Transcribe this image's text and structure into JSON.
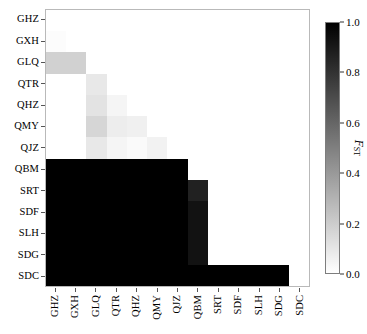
{
  "chart_data": {
    "type": "heatmap",
    "title": "",
    "xlabel": "",
    "ylabel": "",
    "colorbar_label": "F_ST",
    "colorbar_label_main": "F",
    "colorbar_label_sub": "ST",
    "colormap": "grayscale-reversed",
    "colormap_low_color": "#ffffff",
    "colormap_high_color": "#000000",
    "zlim": [
      0.0,
      1.0
    ],
    "colorbar_ticks": [
      "0.0",
      "0.2",
      "0.4",
      "0.6",
      "0.8",
      "1.0"
    ],
    "colorbar_tick_values": [
      0.0,
      0.2,
      0.4,
      0.6,
      0.8,
      1.0
    ],
    "grid": false,
    "legend_position": "right",
    "x_categories": [
      "GHZ",
      "GXH",
      "GLQ",
      "QTR",
      "QHZ",
      "QMY",
      "QJZ",
      "QBM",
      "SRT",
      "SDF",
      "SLH",
      "SDG",
      "SDC"
    ],
    "y_categories": [
      "GHZ",
      "GXH",
      "GLQ",
      "QTR",
      "QHZ",
      "QMY",
      "QJZ",
      "QBM",
      "SRT",
      "SDF",
      "SLH",
      "SDG",
      "SDC"
    ],
    "matrix_note": "Lower-triangular pairwise FST matrix; upper triangle and diagonal blank (white).",
    "values": [
      [
        null,
        null,
        null,
        null,
        null,
        null,
        null,
        null,
        null,
        null,
        null,
        null,
        null
      ],
      [
        0.01,
        null,
        null,
        null,
        null,
        null,
        null,
        null,
        null,
        null,
        null,
        null,
        null
      ],
      [
        0.18,
        0.18,
        null,
        null,
        null,
        null,
        null,
        null,
        null,
        null,
        null,
        null,
        null
      ],
      [
        0.0,
        0.0,
        0.09,
        null,
        null,
        null,
        null,
        null,
        null,
        null,
        null,
        null,
        null
      ],
      [
        0.0,
        0.0,
        0.11,
        0.04,
        null,
        null,
        null,
        null,
        null,
        null,
        null,
        null,
        null
      ],
      [
        0.0,
        0.0,
        0.16,
        0.07,
        0.06,
        null,
        null,
        null,
        null,
        null,
        null,
        null,
        null
      ],
      [
        0.0,
        0.0,
        0.09,
        0.04,
        0.02,
        0.05,
        null,
        null,
        null,
        null,
        null,
        null,
        null
      ],
      [
        1.0,
        1.0,
        1.0,
        1.0,
        1.0,
        1.0,
        1.0,
        null,
        null,
        null,
        null,
        null,
        null
      ],
      [
        1.0,
        1.0,
        1.0,
        1.0,
        1.0,
        1.0,
        1.0,
        0.87,
        null,
        null,
        null,
        null,
        null
      ],
      [
        1.0,
        1.0,
        1.0,
        1.0,
        1.0,
        1.0,
        1.0,
        0.93,
        0.0,
        null,
        null,
        null,
        null
      ],
      [
        1.0,
        1.0,
        1.0,
        1.0,
        1.0,
        1.0,
        1.0,
        0.93,
        0.0,
        0.0,
        null,
        null,
        null
      ],
      [
        1.0,
        1.0,
        1.0,
        1.0,
        1.0,
        1.0,
        1.0,
        0.93,
        0.0,
        0.0,
        0.0,
        null,
        null
      ],
      [
        1.0,
        1.0,
        1.0,
        1.0,
        1.0,
        1.0,
        1.0,
        1.0,
        1.0,
        1.0,
        1.0,
        1.0,
        null
      ]
    ]
  }
}
